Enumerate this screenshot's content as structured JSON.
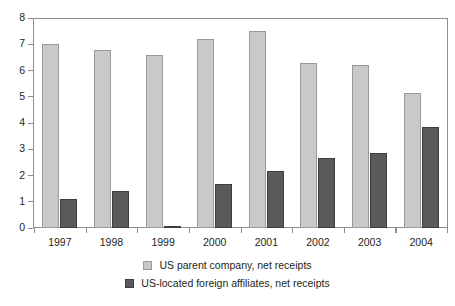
{
  "chart_data": {
    "type": "bar",
    "title": "",
    "subtitle": "",
    "xlabel": "",
    "ylabel": "",
    "ylim": [
      0,
      8
    ],
    "yticks": [
      0,
      1,
      2,
      3,
      4,
      5,
      6,
      7,
      8
    ],
    "ytick_labels": [
      "0",
      "1",
      "2",
      "3",
      "4",
      "5",
      "6",
      "7",
      "8"
    ],
    "grid": false,
    "legend_position": "bottom",
    "categories": [
      "1997",
      "1998",
      "1999",
      "2000",
      "2001",
      "2002",
      "2003",
      "2004"
    ],
    "series": [
      {
        "name": "US parent company, net receipts",
        "color": "#c9c9c9",
        "values": [
          7.0,
          6.8,
          6.6,
          7.2,
          7.5,
          6.3,
          6.2,
          5.15
        ]
      },
      {
        "name": "US-located foreign affiliates, net receipts",
        "color": "#5a5a5a",
        "values": [
          1.1,
          1.4,
          0.08,
          1.68,
          2.18,
          2.65,
          2.85,
          3.85
        ]
      }
    ]
  },
  "legend": {
    "items": [
      {
        "label": "US parent company, net receipts",
        "swatch": "series-a"
      },
      {
        "label": "US-located foreign affiliates, net receipts",
        "swatch": "series-b"
      }
    ]
  },
  "colors": {
    "series_a": "#c9c9c9",
    "series_b": "#5a5a5a",
    "axis": "#8d8d8d",
    "text": "#231f20",
    "background": "#ffffff"
  }
}
